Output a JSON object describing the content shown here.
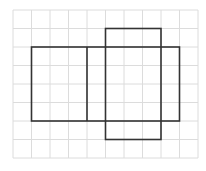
{
  "diagram": {
    "type": "cuboid-net-on-grid",
    "grid": {
      "columns": 10,
      "rows": 8,
      "origin_px": [
        13,
        10
      ],
      "cell_px": 18.5,
      "line_color": "#dcdcdc"
    },
    "shapes": [
      {
        "id": "wide-rectangle",
        "col": 1,
        "row": 2,
        "width_cells": 8,
        "height_cells": 4
      },
      {
        "id": "divider-line",
        "x1_col": 4,
        "y1_row": 2,
        "x2_col": 4,
        "y2_row": 6
      },
      {
        "id": "tall-rectangle",
        "col": 5,
        "row": 1,
        "width_cells": 3,
        "height_cells": 6
      }
    ],
    "stroke_color": "#333333",
    "stroke_width": 1.6
  }
}
